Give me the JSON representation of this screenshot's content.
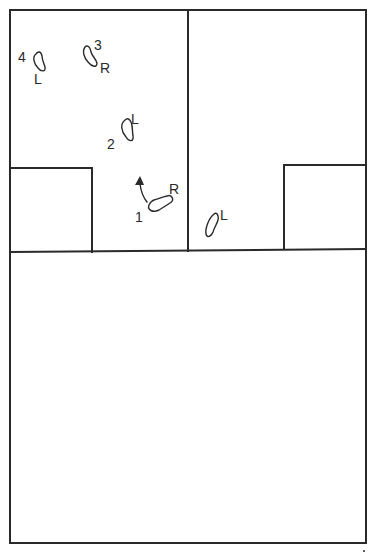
{
  "diagram": {
    "type": "footstep-sequence-floor-plan",
    "colors": {
      "ink": "#2a2a2a",
      "background": "#ffffff"
    },
    "steps": [
      {
        "number": "1",
        "side": "R"
      },
      {
        "number": "2",
        "side": "L"
      },
      {
        "number": "3",
        "side": "R"
      },
      {
        "number": "4",
        "side": "L"
      }
    ],
    "extra_footprint": {
      "side": "L"
    },
    "arrow": {
      "icon": "arrow-up-icon"
    }
  }
}
